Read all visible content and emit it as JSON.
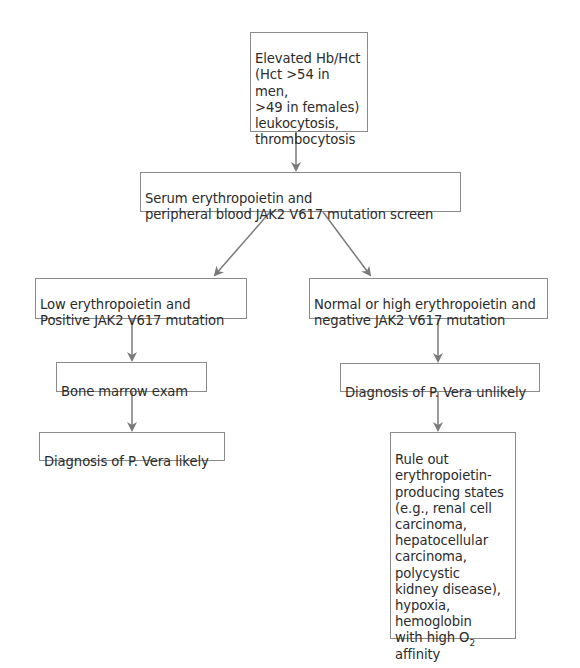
{
  "diagram": {
    "type": "flowchart",
    "nodes": {
      "start": {
        "text": "Elevated Hb/Hct\n(Hct >54 in men,\n>49 in females)\nleukocytosis,\nthrombocytosis"
      },
      "screen": {
        "text": "Serum erythropoietin and\nperipheral blood JAK2 V617 mutation screen"
      },
      "low_epo": {
        "text": "Low erythropoietin and\nPositive JAK2 V617 mutation"
      },
      "high_epo": {
        "text": "Normal or high erythropoietin and\nnegative JAK2 V617 mutation"
      },
      "bone_marrow": {
        "text": "Bone marrow exam"
      },
      "likely": {
        "text": "Diagnosis of P. Vera likely"
      },
      "unlikely": {
        "text": "Diagnosis of P. Vera unlikely"
      },
      "rule_out": {
        "text": "Rule out\nerythropoietin-\nproducing states\n(e.g., renal cell\ncarcinoma,\nhepatocellular\ncarcinoma,\npolycystic\nkidney disease),\nhypoxia, hemoglobin\nwith high O",
        "subscript": "2",
        "tail": " affinity"
      }
    },
    "edges": [
      {
        "from": "start",
        "to": "screen"
      },
      {
        "from": "screen",
        "to": "low_epo"
      },
      {
        "from": "screen",
        "to": "high_epo"
      },
      {
        "from": "low_epo",
        "to": "bone_marrow"
      },
      {
        "from": "bone_marrow",
        "to": "likely"
      },
      {
        "from": "high_epo",
        "to": "unlikely"
      },
      {
        "from": "unlikely",
        "to": "rule_out"
      }
    ],
    "colors": {
      "border": "#8a8a8a",
      "arrow": "#7a7a7a",
      "text": "#2b2b2b"
    }
  }
}
